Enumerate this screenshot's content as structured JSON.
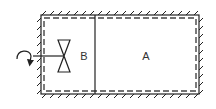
{
  "diagram": {
    "type": "thermodynamic-container",
    "compartments": [
      {
        "id": "B",
        "label": "B"
      },
      {
        "id": "A",
        "label": "A"
      }
    ],
    "elements": {
      "walls": "hatched-insulated",
      "inner_boundary": "dashed",
      "partition": "solid-line",
      "valve": "bowtie-valve",
      "actuator": "curved-arrow"
    },
    "colors": {
      "stroke": "#222222",
      "dash": "#444444",
      "text": "#333333",
      "background": "#ffffff"
    }
  }
}
